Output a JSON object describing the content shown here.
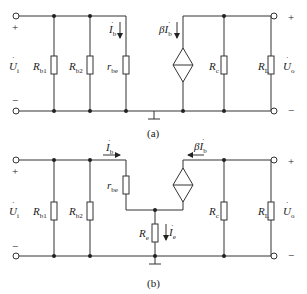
{
  "header_fragment": "",
  "circuit_a": {
    "caption": "(a)",
    "input_label": "U",
    "input_sub": "i",
    "plus": "+",
    "minus": "−",
    "resistors": [
      {
        "name": "R",
        "sub": "b1"
      },
      {
        "name": "R",
        "sub": "b2"
      },
      {
        "name": "r",
        "sub": "be"
      },
      {
        "name": "R",
        "sub": "c"
      },
      {
        "name": "R",
        "sub": "L"
      }
    ],
    "current_ib": {
      "name": "I",
      "sub": "b"
    },
    "source": {
      "prefix": "βI",
      "sub": "b"
    },
    "output_label": "U",
    "output_sub": "o"
  },
  "circuit_b": {
    "caption": "(b)",
    "input_label": "U",
    "input_sub": "i",
    "plus": "+",
    "minus": "−",
    "resistors": [
      {
        "name": "R",
        "sub": "b1"
      },
      {
        "name": "R",
        "sub": "b2"
      },
      {
        "name": "r",
        "sub": "be"
      },
      {
        "name": "R",
        "sub": "e"
      },
      {
        "name": "R",
        "sub": "c"
      },
      {
        "name": "R",
        "sub": "L"
      }
    ],
    "current_ib": {
      "name": "I",
      "sub": "b"
    },
    "current_ie": {
      "name": "I",
      "sub": "e"
    },
    "source": {
      "prefix": "βI",
      "sub": "b"
    },
    "output_label": "U",
    "output_sub": "o"
  }
}
